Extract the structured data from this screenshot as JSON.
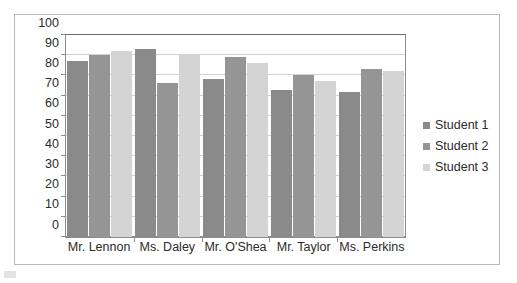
{
  "chart_data": {
    "type": "bar",
    "title": "",
    "subtitle": "",
    "xlabel": "",
    "ylabel": "",
    "ylim": [
      0,
      100
    ],
    "ytick_step": 10,
    "yticks": [
      100,
      90,
      80,
      70,
      60,
      50,
      40,
      30,
      20,
      10,
      0
    ],
    "grid": true,
    "legend_position": "right",
    "categories": [
      "Mr. Lennon",
      "Ms. Daley",
      "Mr. O'Shea",
      "Mr. Taylor",
      "Ms. Perkins"
    ],
    "series": [
      {
        "name": "Student 1",
        "color": "#8a8a8a",
        "values": [
          87,
          93,
          78,
          73,
          72
        ]
      },
      {
        "name": "Student 2",
        "color": "#959595",
        "values": [
          90,
          76,
          89,
          80,
          83
        ]
      },
      {
        "name": "Student 3",
        "color": "#d4d4d4",
        "values": [
          92,
          90,
          86,
          77,
          82
        ]
      }
    ]
  },
  "legend": {
    "items": [
      {
        "label": "Student 1"
      },
      {
        "label": "Student 2"
      },
      {
        "label": "Student 3"
      }
    ]
  },
  "colors": {
    "series_1": "#8a8a8a",
    "series_2": "#959595",
    "series_3": "#d4d4d4",
    "gridline": "#d2d2d2",
    "axis": "#8d8d8d",
    "frame": "#b9b9b9",
    "text": "#2b2b2b"
  }
}
